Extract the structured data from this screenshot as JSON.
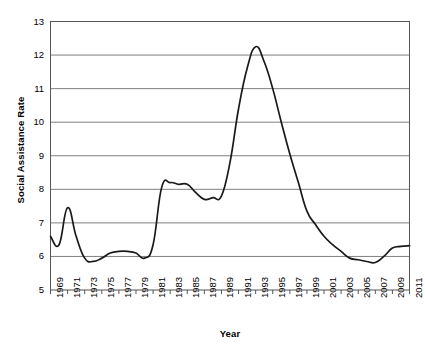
{
  "chart_data": {
    "type": "line",
    "title": "",
    "xlabel": "Year",
    "ylabel": "Social Assistance Rate",
    "xlim": [
      1969,
      2011
    ],
    "ylim": [
      5,
      13
    ],
    "grid": true,
    "grid_axis": "y",
    "legend": false,
    "line_color": "#1a1a1a",
    "grid_color": "#808080",
    "axis_color": "#555555",
    "background_color": "#ffffff",
    "y_ticks": [
      5,
      6,
      7,
      8,
      9,
      10,
      11,
      12,
      13
    ],
    "y_tick_labels": [
      "5",
      "6",
      "7",
      "8",
      "9",
      "10",
      "11",
      "12",
      "13"
    ],
    "x_ticks": [
      1969,
      1971,
      1973,
      1975,
      1977,
      1979,
      1981,
      1983,
      1985,
      1987,
      1989,
      1991,
      1993,
      1995,
      1997,
      1999,
      2001,
      2003,
      2005,
      2007,
      2009,
      2011
    ],
    "x_tick_labels": [
      "1969",
      "1971",
      "1973",
      "1975",
      "1977",
      "1979",
      "1981",
      "1983",
      "1985",
      "1987",
      "1989",
      "1991",
      "1993",
      "1995",
      "1997",
      "1999",
      "2001",
      "2003",
      "2005",
      "2007",
      "2009",
      "2011"
    ],
    "x": [
      1969,
      1970,
      1971,
      1972,
      1973,
      1974,
      1975,
      1976,
      1977,
      1978,
      1979,
      1980,
      1981,
      1982,
      1983,
      1984,
      1985,
      1986,
      1987,
      1988,
      1989,
      1990,
      1991,
      1992,
      1993,
      1994,
      1995,
      1996,
      1997,
      1998,
      1999,
      2000,
      2001,
      2002,
      2003,
      2004,
      2005,
      2006,
      2007,
      2008,
      2009,
      2010,
      2011
    ],
    "values": [
      6.6,
      6.35,
      7.45,
      6.6,
      5.95,
      5.85,
      5.95,
      6.1,
      6.15,
      6.15,
      6.1,
      5.95,
      6.35,
      8.05,
      8.2,
      8.15,
      8.15,
      7.9,
      7.7,
      7.75,
      7.8,
      8.8,
      10.4,
      11.6,
      12.25,
      11.8,
      11.0,
      10.0,
      9.05,
      8.2,
      7.35,
      6.95,
      6.6,
      6.35,
      6.15,
      5.95,
      5.9,
      5.85,
      5.82,
      6.0,
      6.25,
      6.3,
      6.32
    ]
  }
}
